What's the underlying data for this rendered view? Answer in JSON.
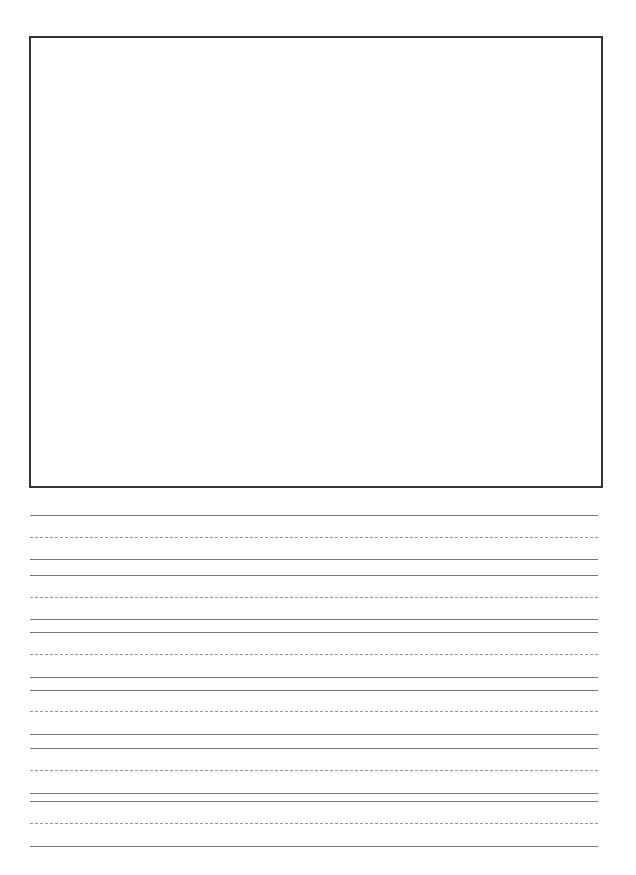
{
  "worksheet": {
    "drawing_box": {
      "label": ""
    },
    "writing_lines": [
      {
        "type": "solid",
        "y": 515
      },
      {
        "type": "dashed",
        "y": 537
      },
      {
        "type": "solid",
        "y": 559
      },
      {
        "type": "solid",
        "y": 575
      },
      {
        "type": "dashed",
        "y": 597
      },
      {
        "type": "solid",
        "y": 619
      },
      {
        "type": "solid",
        "y": 632
      },
      {
        "type": "dashed",
        "y": 654
      },
      {
        "type": "solid",
        "y": 677
      },
      {
        "type": "solid",
        "y": 690
      },
      {
        "type": "dashed",
        "y": 711
      },
      {
        "type": "solid",
        "y": 734
      },
      {
        "type": "solid",
        "y": 748
      },
      {
        "type": "dashed",
        "y": 770
      },
      {
        "type": "solid",
        "y": 793
      },
      {
        "type": "solid",
        "y": 801
      },
      {
        "type": "dashed",
        "y": 823
      },
      {
        "type": "solid",
        "y": 846
      }
    ]
  }
}
